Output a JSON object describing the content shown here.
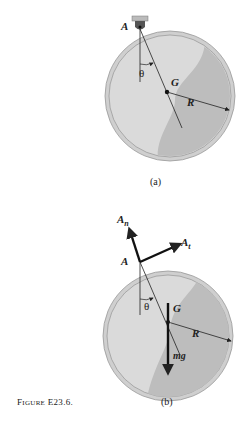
{
  "figure": {
    "caption_prefix": "F",
    "caption_smallcaps": "IGURE",
    "caption_number": " E23.6."
  },
  "panel_a": {
    "label": "(a)",
    "pivot": "A",
    "angle": "θ",
    "center": "G",
    "radius": "R"
  },
  "panel_b": {
    "label": "(b)",
    "pivot": "A",
    "angle": "θ",
    "center": "G",
    "radius": "R",
    "force_normal": "A",
    "force_normal_sub": "n",
    "force_tangent": "A",
    "force_tangent_sub": "t",
    "weight": "mg"
  },
  "colors": {
    "disk_outer": "#c8c8c8",
    "disk_inner_light": "#d8d8d8",
    "disk_inner_dark": "#b8b8b8",
    "line": "#222222"
  }
}
